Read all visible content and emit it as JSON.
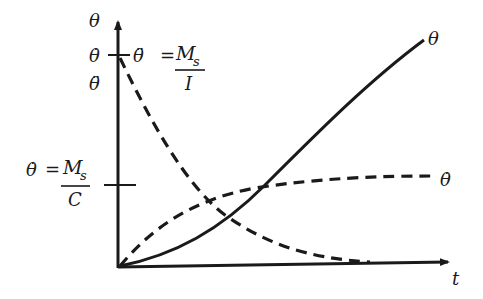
{
  "diagram": {
    "axes": {
      "y_axis_labels": [
        "θ",
        "θ̇",
        "θ̈"
      ],
      "x_axis_label": "t"
    },
    "annotations": {
      "accel_initial": {
        "lhs": "θ̈",
        "equals": "=",
        "numerator": "M",
        "numerator_sub": "s",
        "denominator": "I"
      },
      "rate_final": {
        "lhs": "θ̇",
        "equals": "=",
        "numerator": "M",
        "numerator_sub": "s",
        "denominator": "C"
      }
    },
    "curves": [
      {
        "name": "θ",
        "label": "θ",
        "style": "solid",
        "shape": "accelerating then linear growth"
      },
      {
        "name": "θ̇",
        "label": "θ̇",
        "style": "dashed",
        "shape": "exponential rise to M_s/C"
      },
      {
        "name": "θ̈",
        "label": "",
        "style": "dashed",
        "shape": "exponential decay from M_s/I to 0"
      }
    ],
    "colors": {
      "ink": "#1a1a1a",
      "background": "#ffffff"
    }
  }
}
